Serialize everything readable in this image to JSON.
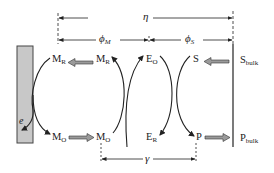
{
  "diagram": {
    "type": "electrochemical mediated reaction scheme",
    "colors": {
      "electrode_fill": "#c8c8c8",
      "line": "#222222",
      "arrow_fill": "#9a9a9a"
    },
    "species": {
      "mr_electrode": {
        "base": "M",
        "sub": "R"
      },
      "mr_film": {
        "base": "M",
        "sub": "R"
      },
      "eo": {
        "base": "E",
        "sub": "O"
      },
      "s": {
        "base": "S",
        "sub": ""
      },
      "s_bulk": {
        "base": "S",
        "sub": "bulk"
      },
      "mo_electrode": {
        "base": "M",
        "sub": "O"
      },
      "mo_film": {
        "base": "M",
        "sub": "O"
      },
      "er": {
        "base": "E",
        "sub": "R"
      },
      "p": {
        "base": "P",
        "sub": ""
      },
      "p_bulk": {
        "base": "P",
        "sub": "bulk"
      }
    },
    "electron_label": "e",
    "dimensions": {
      "eta": {
        "symbol": "η",
        "sub": ""
      },
      "phi_m": {
        "symbol": "ϕ",
        "sub": "M"
      },
      "phi_s": {
        "symbol": "ϕ",
        "sub": "S"
      },
      "gamma": {
        "symbol": "γ",
        "sub": ""
      }
    }
  }
}
